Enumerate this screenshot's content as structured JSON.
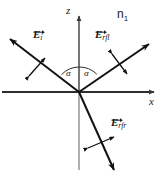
{
  "figure": {
    "width": 162,
    "height": 178,
    "background_color": "#ffffff",
    "line_color": "#1a1a1a",
    "axis_color": "#555555"
  },
  "axes": {
    "vertical": {
      "label": "z",
      "direction": "up",
      "arrowhead": true,
      "origin_px": [
        79,
        92
      ],
      "top_px": [
        79,
        14
      ],
      "bottom_px": [
        79,
        170
      ]
    },
    "horizontal": {
      "label": "x",
      "direction": "right",
      "arrowhead": true,
      "left_px": [
        2,
        92
      ],
      "right_px": [
        157,
        92
      ]
    }
  },
  "media": {
    "upper_label": "n",
    "upper_label_subscript": "1",
    "upper_label_full": "n₁"
  },
  "angles": [
    {
      "name": "angle-of-incidence",
      "label": "α",
      "position_px": [
        70,
        74
      ],
      "side": "left-of-z-axis"
    },
    {
      "name": "angle-of-reflection",
      "label": "α",
      "position_px": [
        88,
        74
      ],
      "side": "right-of-z-axis"
    }
  ],
  "rays": [
    {
      "name": "incident-ray",
      "label_base": "E",
      "label_subscript": "i",
      "label_full": "E⃗ᵢ",
      "has_vector_arrow": true,
      "direction": "toward-origin-from-upper-left",
      "arrowhead_at_px": [
        8,
        38
      ],
      "origin_px": [
        79,
        92
      ],
      "polarization_marker": "double-headed-arrow-perpendicular-to-ray"
    },
    {
      "name": "reflected-ray",
      "label_base": "E",
      "label_subscript": "rfl",
      "label_full": "E⃗_rfl",
      "has_vector_arrow": true,
      "direction": "away-from-origin-toward-upper-right",
      "arrowhead_at_px": [
        151,
        42
      ],
      "origin_px": [
        79,
        92
      ],
      "polarization_marker": "double-headed-arrow-perpendicular-to-ray"
    },
    {
      "name": "refracted-ray",
      "label_base": "E",
      "label_subscript": "rfr",
      "label_full": "E⃗_rfr",
      "has_vector_arrow": true,
      "direction": "away-from-origin-toward-lower-right",
      "arrowhead_at_px": [
        116,
        172
      ],
      "origin_px": [
        79,
        92
      ],
      "polarization_marker": "double-headed-arrow-perpendicular-to-ray"
    }
  ]
}
